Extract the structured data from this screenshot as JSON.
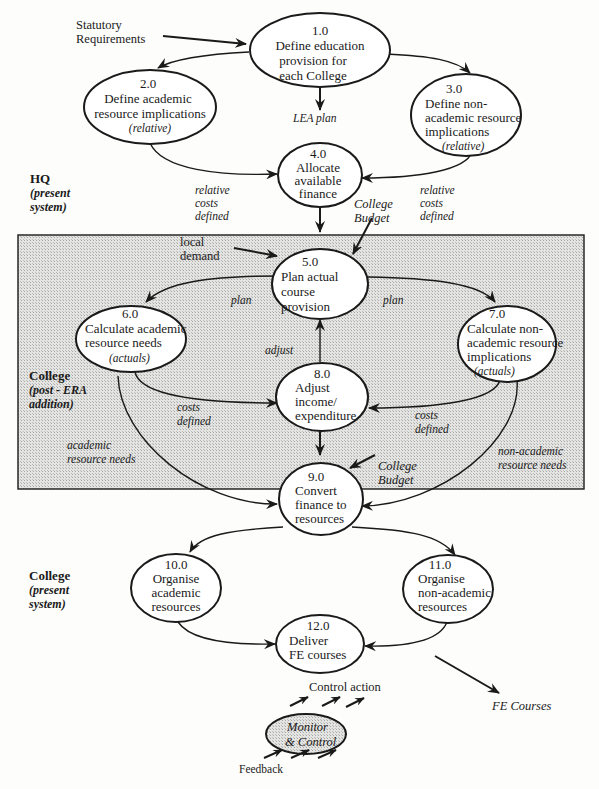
{
  "diagram": {
    "title": "",
    "colors": {
      "ink": "#1a1a1a",
      "paper": "#fdfdfb",
      "shaded_region": "#d9d9d9"
    },
    "external_inputs": {
      "statutory": [
        "Statutory",
        "Requirements"
      ],
      "local_demand": [
        "local",
        "demand"
      ],
      "fe_courses": "FE Courses"
    },
    "zones": {
      "hq": {
        "title": "HQ",
        "sub": [
          "(present",
          "system)"
        ]
      },
      "college_post": {
        "title": "College",
        "sub": [
          "(post - ERA",
          "addition)"
        ]
      },
      "college_present": {
        "title": "College",
        "sub": [
          "(present",
          "system)"
        ]
      }
    },
    "processes": [
      {
        "id": "1.0",
        "lines": [
          "Define education",
          "provision for",
          "each College"
        ]
      },
      {
        "id": "2.0",
        "lines": [
          "Define academic",
          "resource implications"
        ],
        "note": "(relative)"
      },
      {
        "id": "3.0",
        "lines": [
          "Define non-",
          "academic resource",
          "implications"
        ],
        "note": "(relative)"
      },
      {
        "id": "4.0",
        "lines": [
          "Allocate",
          "available",
          "finance"
        ]
      },
      {
        "id": "5.0",
        "lines": [
          "Plan actual",
          "course",
          "provision"
        ]
      },
      {
        "id": "6.0",
        "lines": [
          "Calculate academic",
          "resource needs"
        ],
        "note": "(actuals)"
      },
      {
        "id": "7.0",
        "lines": [
          "Calculate non-",
          "academic resource",
          "implications"
        ],
        "note": "(actuals)"
      },
      {
        "id": "8.0",
        "lines": [
          "Adjust",
          "income/",
          "expenditure"
        ]
      },
      {
        "id": "9.0",
        "lines": [
          "Convert",
          "finance to",
          "resources"
        ]
      },
      {
        "id": "10.0",
        "lines": [
          "Organise",
          "academic",
          "resources"
        ]
      },
      {
        "id": "11.0",
        "lines": [
          "Organise",
          "non-academic",
          "resources"
        ]
      },
      {
        "id": "12.0",
        "lines": [
          "Deliver",
          "FE courses"
        ]
      }
    ],
    "flow_labels": {
      "lea_plan": "LEA plan",
      "relative_costs_left": [
        "relative",
        "costs",
        "defined"
      ],
      "relative_costs_right": [
        "relative",
        "costs",
        "defined"
      ],
      "college_budget_top": [
        "College",
        "Budget"
      ],
      "plan_left": "plan",
      "plan_right": "plan",
      "adjust": "adjust",
      "costs_left": [
        "costs",
        "defined"
      ],
      "costs_right": [
        "costs",
        "defined"
      ],
      "academic_needs": [
        "academic",
        "resource needs"
      ],
      "non_academic_needs": [
        "non-academic",
        "resource needs"
      ],
      "college_budget_bottom": [
        "College",
        "Budget"
      ]
    },
    "monitor": {
      "lines": [
        "Monitor",
        "& Control"
      ],
      "control_action": "Control action",
      "feedback": "Feedback"
    }
  }
}
